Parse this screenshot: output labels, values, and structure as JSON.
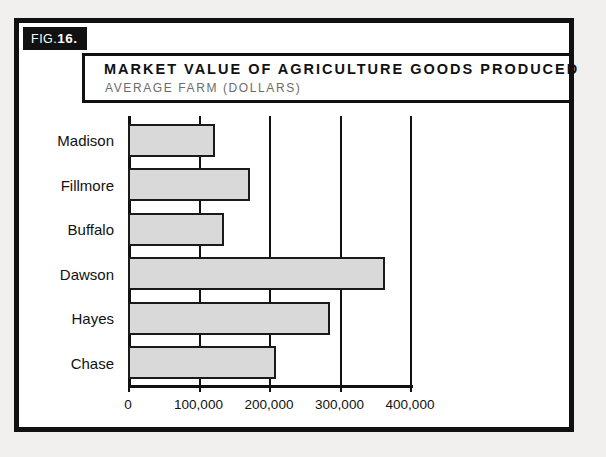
{
  "figure": {
    "prefix": "FIG.",
    "number": "16."
  },
  "title": {
    "main": "MARKET VALUE OF AGRICULTURE GOODS PRODUCED",
    "sub": "AVERAGE FARM (DOLLARS)"
  },
  "chart_data": {
    "type": "bar",
    "orientation": "horizontal",
    "title": "MARKET VALUE OF AGRICULTURE GOODS PRODUCED",
    "subtitle": "AVERAGE FARM (DOLLARS)",
    "xlabel": "",
    "ylabel": "",
    "categories": [
      "Madison",
      "Fillmore",
      "Buffalo",
      "Dawson",
      "Hayes",
      "Chase"
    ],
    "values": [
      124000,
      173000,
      136000,
      365000,
      286000,
      210000
    ],
    "xlim": [
      0,
      400000
    ],
    "xticks": [
      0,
      100000,
      200000,
      300000,
      400000
    ],
    "xtick_labels": [
      "0",
      "100,000",
      "200,000",
      "300,000",
      "400,000"
    ],
    "grid": true,
    "legend": false,
    "bar_fill": "#d9d9d9",
    "bar_stroke": "#1a1a1a"
  },
  "colors": {
    "frame": "#111111",
    "background": "#ffffff",
    "page": "#f2f0ee",
    "subtitle": "#6c6c6c"
  }
}
